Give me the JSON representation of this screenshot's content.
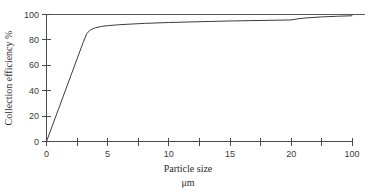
{
  "chart_data": {
    "type": "line",
    "title": "",
    "xlabel": "Particle size",
    "xlabel_units": "μm",
    "ylabel": "Collection efficiency %",
    "x_tick_labels": [
      "0",
      "5",
      "10",
      "15",
      "20",
      "100"
    ],
    "x_tick_values": [
      0,
      5,
      10,
      15,
      20,
      100
    ],
    "x_minor_tick_count": 5,
    "x_total_tick_count": 11,
    "y_tick_labels": [
      "0",
      "20",
      "40",
      "60",
      "80",
      "100"
    ],
    "y_tick_values": [
      0,
      20,
      40,
      60,
      80,
      100
    ],
    "ylim": [
      0,
      100
    ],
    "xlim": [
      0,
      100
    ],
    "grid": false,
    "legend": null,
    "series": [
      {
        "name": "Collection efficiency",
        "x": [
          0,
          0.5,
          1,
          1.5,
          2,
          2.5,
          3,
          3.3,
          3.6,
          4,
          4.5,
          5,
          6,
          7,
          8,
          10,
          12,
          15,
          20,
          30,
          40,
          60,
          80,
          100
        ],
        "values": [
          0,
          13,
          26,
          39,
          52,
          65,
          78,
          85,
          88,
          89.6,
          90.6,
          91.2,
          92,
          92.5,
          93,
          93.7,
          94.2,
          94.9,
          95.7,
          96.7,
          97.3,
          98.1,
          98.6,
          99
        ]
      }
    ],
    "annotations": []
  },
  "axis_titles": {
    "x_line1": "Particle size",
    "x_line2": "μm",
    "y": "Collection efficiency %"
  },
  "colors": {
    "curve": "#3c3c3c",
    "axis": "#4a4a4a",
    "background": "#ffffff",
    "text": "#2b2b2b"
  }
}
